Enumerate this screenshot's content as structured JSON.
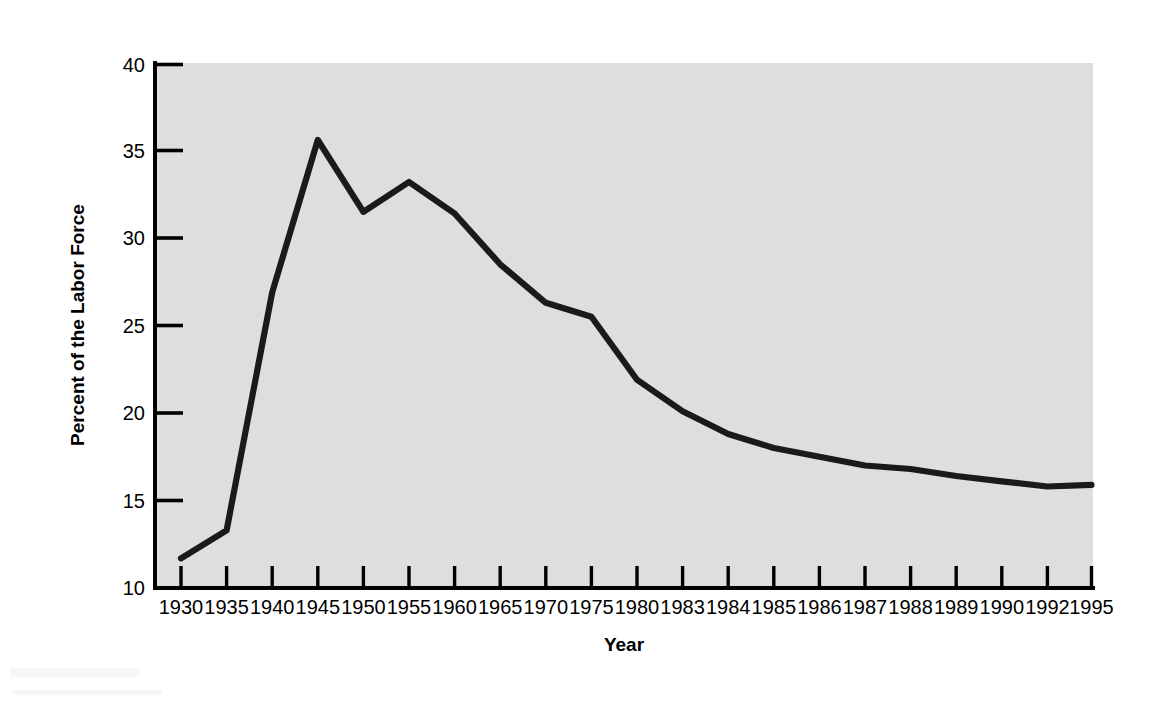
{
  "chart_data": {
    "type": "line",
    "title": "",
    "subtitle": "",
    "xlabel": "Year",
    "ylabel": "Percent of the Labor Force",
    "categories": [
      "1930",
      "1935",
      "1940",
      "1945",
      "1950",
      "1955",
      "1960",
      "1965",
      "1970",
      "1975",
      "1980",
      "1983",
      "1984",
      "1985",
      "1986",
      "1987",
      "1988",
      "1989",
      "1990",
      "1992",
      "1995"
    ],
    "x_tick_labels": [
      "1930",
      "1935",
      "1940",
      "1945",
      "1950",
      "1955",
      "1960",
      "1965",
      "1970",
      "1975",
      "1980",
      "1983",
      "1984",
      "1985",
      "1986",
      "1987",
      "1988",
      "1989",
      "1990",
      "1992",
      "1995"
    ],
    "y_tick_labels": [
      "10",
      "15",
      "20",
      "25",
      "30",
      "35",
      "40"
    ],
    "y_ticks": [
      10,
      15,
      20,
      25,
      30,
      35,
      40
    ],
    "values": [
      11.7,
      13.3,
      26.9,
      35.6,
      31.5,
      33.2,
      31.4,
      28.5,
      26.3,
      25.5,
      21.9,
      20.1,
      18.8,
      18.0,
      17.5,
      17.0,
      16.8,
      16.4,
      16.1,
      15.8,
      15.9
    ],
    "series": [
      {
        "name": "Percent of the Labor Force",
        "values": [
          11.7,
          13.3,
          26.9,
          35.6,
          31.5,
          33.2,
          31.4,
          28.5,
          26.3,
          25.5,
          21.9,
          20.1,
          18.8,
          18.0,
          17.5,
          17.0,
          16.8,
          16.4,
          16.1,
          15.8,
          15.9
        ]
      }
    ],
    "ylim": [
      10,
      40
    ],
    "grid": false,
    "legend": false,
    "legend_position": "none",
    "line_color": "#1a1a1a",
    "plot_background_color": "#dededc",
    "page_background_color": "#ffffff",
    "axis_color": "#000000",
    "annotations": []
  }
}
